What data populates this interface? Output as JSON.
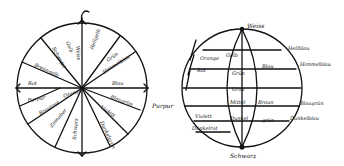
{
  "figure": {
    "type": "historical hand-drawn color diagrams",
    "ink_color": "#111111",
    "background": "#ffffff"
  },
  "color_circle": {
    "center": [
      82,
      88
    ],
    "radius": 65,
    "labels": [
      {
        "text": "Schwefel",
        "x": 52,
        "y": 48,
        "rot": 62
      },
      {
        "text": "Gelb",
        "x": 66,
        "y": 42,
        "rot": 70
      },
      {
        "text": "Weiss",
        "x": 76,
        "y": 46,
        "rot": 85
      },
      {
        "text": "Hellgelb",
        "x": 93,
        "y": 50,
        "rot": -70
      },
      {
        "text": "Grün",
        "x": 108,
        "y": 62,
        "rot": -35
      },
      {
        "text": "Himmelblau",
        "x": 104,
        "y": 74,
        "rot": -32
      },
      {
        "text": "Blau",
        "x": 112,
        "y": 85,
        "rot": 0
      },
      {
        "text": "Blaugrün",
        "x": 110,
        "y": 98,
        "rot": 20
      },
      {
        "text": "Violett",
        "x": 100,
        "y": 108,
        "rot": 35
      },
      {
        "text": "Dunkelgrün",
        "x": 100,
        "y": 122,
        "rot": 65
      },
      {
        "text": "Schwarz",
        "x": 76,
        "y": 140,
        "rot": -85
      },
      {
        "text": "Zinnober",
        "x": 52,
        "y": 128,
        "rot": -50
      },
      {
        "text": "Braunrot",
        "x": 40,
        "y": 115,
        "rot": -30
      },
      {
        "text": "Purpur",
        "x": 28,
        "y": 102,
        "rot": -10
      },
      {
        "text": "Orange",
        "x": 64,
        "y": 98,
        "rot": -20
      },
      {
        "text": "Rot",
        "x": 28,
        "y": 85,
        "rot": 0
      },
      {
        "text": "Braungelb",
        "x": 34,
        "y": 66,
        "rot": 25
      }
    ]
  },
  "color_sphere": {
    "center": [
      242,
      88
    ],
    "rx": 60,
    "ry": 59,
    "top_label": "Weiss",
    "bottom_label": "Schwarz",
    "left_label": "Purpur",
    "inner_labels": [
      {
        "text": "Gelb",
        "x": 226,
        "y": 57
      },
      {
        "text": "Grün",
        "x": 232,
        "y": 75
      },
      {
        "text": "Grau",
        "x": 232,
        "y": 91
      },
      {
        "text": "Mittel",
        "x": 230,
        "y": 104
      },
      {
        "text": "Dunkel",
        "x": 230,
        "y": 120
      },
      {
        "text": "Orange",
        "x": 200,
        "y": 60
      },
      {
        "text": "Rot",
        "x": 197,
        "y": 72
      },
      {
        "text": "Blau",
        "x": 262,
        "y": 68
      },
      {
        "text": "Braun",
        "x": 258,
        "y": 104
      },
      {
        "text": "grün",
        "x": 262,
        "y": 122
      },
      {
        "text": "Violett",
        "x": 195,
        "y": 118
      },
      {
        "text": "Dunkelrot",
        "x": 192,
        "y": 130
      }
    ],
    "side_labels": [
      {
        "text": "Hellblau",
        "x": 288,
        "y": 50
      },
      {
        "text": "Himmelblau",
        "x": 300,
        "y": 66
      },
      {
        "text": "Blaugrün",
        "x": 300,
        "y": 105
      },
      {
        "text": "Dunkelblau",
        "x": 290,
        "y": 120
      }
    ]
  }
}
